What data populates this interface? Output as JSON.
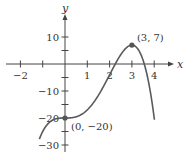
{
  "chart_data": {
    "type": "line",
    "title": "",
    "function": "y = -x^4 + 4x^3 - 20",
    "xlabel": "x",
    "ylabel": "y",
    "xlim": [
      -2.2,
      4.6
    ],
    "ylim": [
      -31,
      18
    ],
    "grid": false,
    "x_ticks": [
      -2,
      -1,
      0,
      1,
      2,
      3,
      4
    ],
    "x_tick_labels": [
      "−2",
      "",
      "",
      "1",
      "2",
      "3",
      "4"
    ],
    "y_ticks": [
      -30,
      -25,
      -20,
      -15,
      -10,
      -5,
      0,
      5,
      10
    ],
    "y_tick_labels": [
      "−30",
      "",
      "−20",
      "",
      "−10",
      "",
      "",
      "",
      "10"
    ],
    "series": [
      {
        "name": "f(x)",
        "color": "#5a5a5a",
        "x": [
          -1.15,
          -1.0,
          -0.5,
          0,
          0.5,
          1,
          1.5,
          2,
          2.5,
          3,
          3.5,
          4.0
        ],
        "values": [
          -28.9,
          -25,
          -20.56,
          -20,
          -19.56,
          -17,
          -11.56,
          -4,
          3.44,
          7,
          1.44,
          -20
        ]
      }
    ],
    "annotations": [
      {
        "text": "(3, 7)",
        "x": 3,
        "y": 7,
        "marker": true
      },
      {
        "text": "(0, −20)",
        "x": 0,
        "y": -20,
        "marker": true
      }
    ]
  }
}
